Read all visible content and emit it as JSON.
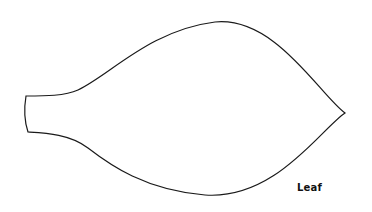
{
  "diagram": {
    "shape": "leaf-outline",
    "label": "Leaf",
    "stroke_color": "#1a1a1a",
    "background": "#ffffff"
  }
}
